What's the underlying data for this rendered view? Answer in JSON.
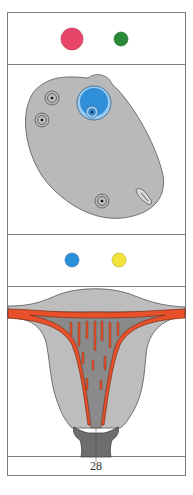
{
  "panels": [
    {
      "name": "hormone-row-top",
      "markers": [
        {
          "label": "pink-dot",
          "color": "#e8456a",
          "cx": 72,
          "cy": 39,
          "r": 11
        },
        {
          "label": "green-dot",
          "color": "#2a8a3a",
          "cx": 121,
          "cy": 39,
          "r": 7
        }
      ]
    },
    {
      "name": "ovary-diagram"
    },
    {
      "name": "hormone-row-bottom",
      "markers": [
        {
          "label": "blue-dot",
          "color": "#2a8fd6",
          "cx": 72,
          "cy": 260,
          "r": 7
        },
        {
          "label": "yellow-dot",
          "color": "#f3e23c",
          "cx": 119,
          "cy": 260,
          "r": 7
        }
      ]
    },
    {
      "name": "uterus-diagram"
    }
  ],
  "colors": {
    "frame": "#7a7a7a",
    "ovary_fill": "#b9b9b9",
    "follicle_blue": "#2f8fd8",
    "follicle_ring": "#9ccdf0",
    "uterus_outer": "#bdbdbd",
    "uterus_inner": "#8a8a8a",
    "endometrium": "#e8502a",
    "cervix": "#6d6d6d"
  },
  "footer": {
    "page_number": "28"
  }
}
